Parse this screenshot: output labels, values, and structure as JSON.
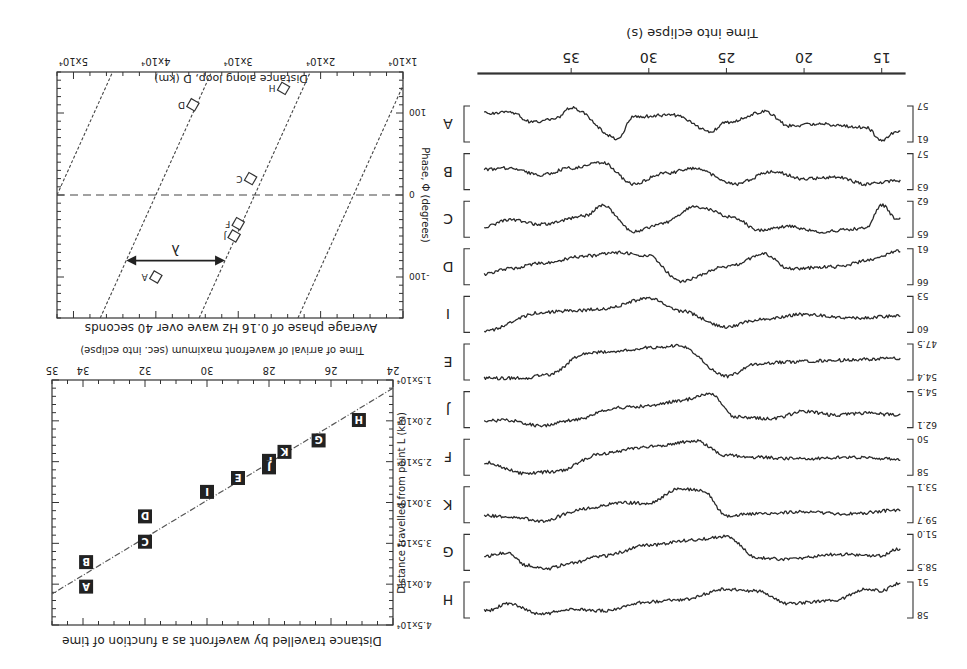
{
  "figure": {
    "orientation_degrees": 180,
    "panels": {
      "traces": {
        "xlabel": "Time into eclipse (s)",
        "xticks": [
          "15",
          "20",
          "25",
          "30",
          "35"
        ],
        "rows": [
          {
            "label": "A",
            "ymin": "57",
            "ymax": "61"
          },
          {
            "label": "B",
            "ymin": "57",
            "ymax": "63"
          },
          {
            "label": "C",
            "ymin": "62",
            "ymax": "65"
          },
          {
            "label": "D",
            "ymin": "61",
            "ymax": "66"
          },
          {
            "label": "I",
            "ymin": "53",
            "ymax": "60"
          },
          {
            "label": "E",
            "ymin": "47.5",
            "ymax": "54.4"
          },
          {
            "label": "J",
            "ymin": "54.5",
            "ymax": "62.1"
          },
          {
            "label": "F",
            "ymin": "50",
            "ymax": "58"
          },
          {
            "label": "K",
            "ymin": "53.1",
            "ymax": "59.7"
          },
          {
            "label": "G",
            "ymin": "51.0",
            "ymax": "58.5"
          },
          {
            "label": "H",
            "ymin": "51",
            "ymax": "58"
          }
        ]
      },
      "phase": {
        "title": "Average phase of 0.16 Hz wave over 40 seconds",
        "xlabel": "Distance along loop, D (km)",
        "ylabel": "Phase, Φ (degrees)",
        "xticks": [
          "1x10⁴",
          "2x10⁴",
          "3x10⁴",
          "4x10⁴",
          "5x10⁴"
        ],
        "yticks": [
          "-100",
          "0",
          "100"
        ],
        "lambda_label": "λ",
        "points": [
          "A",
          "J",
          "F",
          "C",
          "D",
          "H"
        ]
      },
      "wavefront": {
        "title": "Distance travelled by wavefront as a function of time",
        "xlabel": "Time of arrival of wavefront maximum (sec. into eclipse)",
        "ylabel": "Distance travelled from point L (km)",
        "xticks": [
          "24",
          "26",
          "28",
          "30",
          "32",
          "34",
          "35"
        ],
        "yticks": [
          "1.5x10⁴",
          "2.0x10⁴",
          "2.5x10⁴",
          "3.0x10⁴",
          "3.5x10⁴",
          "4.0x10⁴",
          "4.5x10⁴"
        ]
      }
    }
  },
  "chart_data": [
    {
      "type": "line",
      "title": "Light-curve traces (stacked)",
      "xlabel": "Time into eclipse (s)",
      "xlim": [
        13.5,
        41
      ],
      "xticks": [
        15,
        20,
        25,
        30,
        35
      ],
      "series": [
        {
          "name": "A",
          "yrange": [
            57,
            61
          ]
        },
        {
          "name": "B",
          "yrange": [
            57,
            63
          ]
        },
        {
          "name": "C",
          "yrange": [
            62,
            65
          ]
        },
        {
          "name": "D",
          "yrange": [
            61,
            66
          ]
        },
        {
          "name": "I",
          "yrange": [
            53,
            60
          ]
        },
        {
          "name": "E",
          "yrange": [
            47.5,
            54.4
          ]
        },
        {
          "name": "J",
          "yrange": [
            54.5,
            62.1
          ]
        },
        {
          "name": "F",
          "yrange": [
            50,
            58
          ]
        },
        {
          "name": "K",
          "yrange": [
            53.1,
            59.7
          ]
        },
        {
          "name": "G",
          "yrange": [
            51.0,
            58.5
          ]
        },
        {
          "name": "H",
          "yrange": [
            51,
            58
          ]
        }
      ]
    },
    {
      "type": "scatter",
      "title": "Average phase of 0.16 Hz wave over 40 seconds",
      "xlabel": "Distance along loop, D (km)",
      "ylabel": "Phase, Φ (degrees)",
      "xlim": [
        10000,
        52000
      ],
      "ylim": [
        -150,
        150
      ],
      "xticks": [
        10000,
        20000,
        30000,
        40000,
        50000
      ],
      "yticks": [
        -100,
        0,
        100
      ],
      "points": [
        {
          "label": "A",
          "x": 40000,
          "y": -100
        },
        {
          "label": "J",
          "x": 30500,
          "y": -50
        },
        {
          "label": "F",
          "x": 30000,
          "y": -35
        },
        {
          "label": "C",
          "x": 28500,
          "y": 20
        },
        {
          "label": "D",
          "x": 35500,
          "y": 110
        },
        {
          "label": "H",
          "x": 24500,
          "y": 130
        }
      ],
      "guide_lines": "parallel dash-dot lines, spacing λ ≈ 1.2x10⁴ km",
      "annotations": [
        "λ (wavelength arrow)",
        "dashed line at phase 0"
      ]
    },
    {
      "type": "scatter",
      "title": "Distance travelled by wavefront as a function of time",
      "xlabel": "Time of arrival of wavefront maximum (sec. into eclipse)",
      "ylabel": "Distance travelled from point L (km)",
      "xlim": [
        24,
        35
      ],
      "ylim": [
        15000,
        45000
      ],
      "points": [
        {
          "label": "H",
          "x": 25.1,
          "y": 19900
        },
        {
          "label": "G",
          "x": 26.4,
          "y": 22400
        },
        {
          "label": "K",
          "x": 27.5,
          "y": 23800
        },
        {
          "label": "F",
          "x": 28.0,
          "y": 24900
        },
        {
          "label": "J",
          "x": 28.0,
          "y": 25700
        },
        {
          "label": "E",
          "x": 29.0,
          "y": 27000
        },
        {
          "label": "I",
          "x": 30.0,
          "y": 28700
        },
        {
          "label": "D",
          "x": 32.0,
          "y": 31700
        },
        {
          "label": "C",
          "x": 32.0,
          "y": 34800
        },
        {
          "label": "B",
          "x": 33.9,
          "y": 37300
        },
        {
          "label": "A",
          "x": 33.9,
          "y": 40300
        }
      ],
      "fit_line": {
        "x": [
          24,
          35
        ],
        "y": [
          16000,
          41200
        ]
      }
    }
  ]
}
